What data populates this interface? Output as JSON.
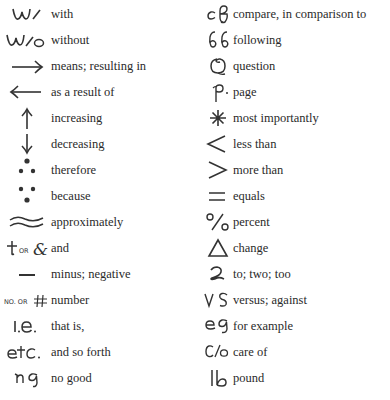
{
  "left_column": [
    {
      "symbol": "w/",
      "icon": "with-symbol-icon",
      "meaning": "with"
    },
    {
      "symbol": "w/o",
      "icon": "without-symbol-icon",
      "meaning": "without"
    },
    {
      "symbol": "→",
      "icon": "right-arrow-icon",
      "meaning": "means; resulting in"
    },
    {
      "symbol": "←",
      "icon": "left-arrow-icon",
      "meaning": "as a result of"
    },
    {
      "symbol": "↑",
      "icon": "up-arrow-icon",
      "meaning": "increasing"
    },
    {
      "symbol": "↓",
      "icon": "down-arrow-icon",
      "meaning": "decreasing"
    },
    {
      "symbol": "∴",
      "icon": "therefore-icon",
      "meaning": "therefore"
    },
    {
      "symbol": "∵",
      "icon": "because-icon",
      "meaning": "because"
    },
    {
      "symbol": "≈",
      "icon": "approximately-icon",
      "meaning": "approximately"
    },
    {
      "symbol": "+ or &",
      "icon": "and-symbol-icon",
      "meaning": "and"
    },
    {
      "symbol": "—",
      "icon": "minus-icon",
      "meaning": "minus; negative"
    },
    {
      "symbol": "No. or #",
      "icon": "number-symbol-icon",
      "meaning": "number"
    },
    {
      "symbol": "i.e.",
      "icon": "ie-symbol-icon",
      "meaning": "that is,"
    },
    {
      "symbol": "etc.",
      "icon": "etc-symbol-icon",
      "meaning": "and so forth"
    },
    {
      "symbol": "ng",
      "icon": "ng-symbol-icon",
      "meaning": "no good"
    }
  ],
  "right_column": [
    {
      "symbol": "cf",
      "icon": "cf-symbol-icon",
      "meaning": "compare, in comparison to"
    },
    {
      "symbol": "ff",
      "icon": "ff-symbol-icon",
      "meaning": "following"
    },
    {
      "symbol": "Q",
      "icon": "question-symbol-icon",
      "meaning": "question"
    },
    {
      "symbol": "p.",
      "icon": "page-symbol-icon",
      "meaning": "page"
    },
    {
      "symbol": "*",
      "icon": "asterisk-icon",
      "meaning": "most importantly"
    },
    {
      "symbol": "<",
      "icon": "less-than-icon",
      "meaning": "less than"
    },
    {
      "symbol": ">",
      "icon": "greater-than-icon",
      "meaning": "more than"
    },
    {
      "symbol": "=",
      "icon": "equals-icon",
      "meaning": "equals"
    },
    {
      "symbol": "%",
      "icon": "percent-icon",
      "meaning": "percent"
    },
    {
      "symbol": "Δ",
      "icon": "delta-icon",
      "meaning": "change"
    },
    {
      "symbol": "2",
      "icon": "two-symbol-icon",
      "meaning": "to; two; too"
    },
    {
      "symbol": "vs",
      "icon": "vs-symbol-icon",
      "meaning": "versus; against"
    },
    {
      "symbol": "eg",
      "icon": "eg-symbol-icon",
      "meaning": "for example"
    },
    {
      "symbol": "c/o",
      "icon": "care-of-symbol-icon",
      "meaning": "care of"
    },
    {
      "symbol": "lb",
      "icon": "pound-symbol-icon",
      "meaning": "pound"
    }
  ]
}
